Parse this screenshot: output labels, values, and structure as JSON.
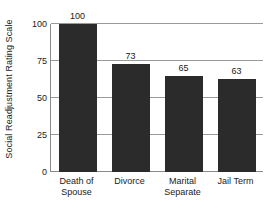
{
  "chart_data": {
    "type": "bar",
    "title": "",
    "xlabel": "",
    "ylabel": "Social Readjustment Rating Scale",
    "categories": [
      "Death of Spouse",
      "Divorce",
      "Marital Separate",
      "Jail Term"
    ],
    "category_lines": [
      [
        "Death of",
        "Spouse"
      ],
      [
        "Divorce"
      ],
      [
        "Marital",
        "Separate"
      ],
      [
        "Jail Term"
      ]
    ],
    "values": [
      100,
      73,
      65,
      63
    ],
    "value_labels": [
      "100",
      "73",
      "65",
      "63"
    ],
    "ylim": [
      0,
      100
    ],
    "yticks": [
      0,
      25,
      50,
      75,
      100
    ],
    "ytick_labels": [
      "0",
      "25",
      "50",
      "75",
      "100"
    ],
    "grid": true,
    "legend": "none",
    "bar_color": "#2b2b2b",
    "grid_color": "#9a9a9a",
    "axis_color": "#8a8a8a",
    "text_color": "#1a1a1a",
    "background": "#ffffff"
  }
}
